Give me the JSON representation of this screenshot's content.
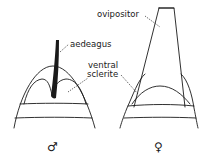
{
  "figure": {
    "labels": {
      "ovipositor": "ovipositor",
      "aedeagus": "aedeagus",
      "ventral_line1": "ventral",
      "ventral_line2": "sclerite"
    },
    "panels": [
      {
        "id": "male",
        "symbol": "♂"
      },
      {
        "id": "female",
        "symbol": "♀"
      }
    ],
    "colors": {
      "ink": "#1a1a1a",
      "background": "#ffffff"
    }
  }
}
